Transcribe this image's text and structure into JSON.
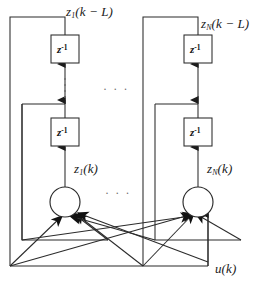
{
  "figure": {
    "type": "block-diagram",
    "background_color": "#ffffff",
    "line_color": "#2b2b2b",
    "text_color": "#1a1a1a",
    "dots_color": "#6d6d6d"
  },
  "labels": {
    "output_left": {
      "base": "z",
      "sub": "1",
      "rest": "(k − L)"
    },
    "output_right": {
      "base": "z",
      "sub": "N",
      "rest": "(k − L)"
    },
    "state_left": {
      "base": "z",
      "sub": "1",
      "rest": "(k)"
    },
    "state_right": {
      "base": "z",
      "sub": "N",
      "rest": "(k)"
    },
    "input": {
      "base": "u",
      "sub": "",
      "rest": "(k)"
    }
  },
  "delay_blocks": [
    {
      "id": "delay-left-top",
      "base": "z",
      "sup": "-1",
      "x": 51,
      "y": 35,
      "w": 28,
      "h": 28
    },
    {
      "id": "delay-left-bottom",
      "base": "z",
      "sup": "-1",
      "x": 51,
      "y": 118,
      "w": 28,
      "h": 28
    },
    {
      "id": "delay-right-top",
      "base": "z",
      "sup": "-1",
      "x": 184,
      "y": 35,
      "w": 28,
      "h": 28
    },
    {
      "id": "delay-right-bottom",
      "base": "z",
      "sup": "-1",
      "x": 184,
      "y": 118,
      "w": 28,
      "h": 28
    }
  ],
  "neurons": [
    {
      "id": "neuron-left",
      "cx": 65,
      "cy": 202,
      "r": 15
    },
    {
      "id": "neuron-right",
      "cx": 198,
      "cy": 202,
      "r": 15
    }
  ],
  "ellipses": {
    "vertical_left": {
      "x": 65,
      "y_from": 76,
      "y_to": 100,
      "dots": 4
    },
    "vertical_right": {
      "x": 198,
      "y_from": 76,
      "y_to": 100,
      "dots": 0
    },
    "horizontal_top": {
      "text": "· · ·",
      "x": 103,
      "y": 88
    },
    "horizontal_bottom": {
      "text": "· · ·",
      "x": 105,
      "y": 192
    }
  },
  "annotations": {
    "columns": 2,
    "delay_taps_per_column": 2,
    "input_signal": "u(k)",
    "outputs": [
      "z_1(k-L)",
      "z_N(k-L)"
    ]
  }
}
